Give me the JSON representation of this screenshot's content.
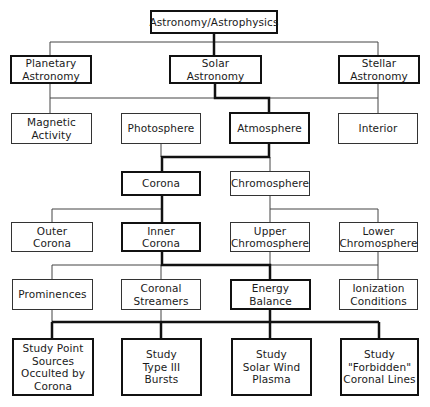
{
  "title": "Astronomy/Astrophysics",
  "colors": {
    "line": "#333333",
    "thick_line": "#111111",
    "background": "#ffffff"
  },
  "nodes": {
    "root": "Astronomy/Astrophysics",
    "planetary": "Planetary\nAstronomy",
    "solar": "Solar\nAstronomy",
    "stellar": "Stellar\nAstronomy",
    "magnetic": "Magnetic\nActivity",
    "photosphere": "Photosphere",
    "atmosphere": "Atmosphere",
    "interior": "Interior",
    "corona": "Corona",
    "chromosphere": "Chromosphere",
    "outer_corona": "Outer\nCorona",
    "inner_corona": "Inner\nCorona",
    "upper_chromo": "Upper\nChromosphere",
    "lower_chromo": "Lower\nChromosphere",
    "prominences": "Prominences",
    "streamers": "Coronal\nStreamers",
    "energy": "Energy\nBalance",
    "ionization": "Ionization\nConditions",
    "study_point": "Study Point\nSources\nOcculted by\nCorona",
    "study_type3": "Study\nType III\nBursts",
    "study_wind": "Study\nSolar Wind\nPlasma",
    "study_forbidden": "Study\n\"Forbidden\"\nCoronal Lines"
  },
  "highlighted_path": [
    "root",
    "solar",
    "atmosphere",
    "corona",
    "inner_corona",
    "energy",
    "study_point",
    "study_type3",
    "study_wind",
    "study_forbidden"
  ]
}
